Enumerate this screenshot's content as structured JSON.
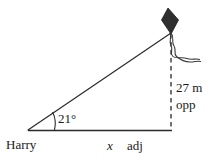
{
  "figure": {
    "type": "right-triangle-trigonometry-diagram",
    "labels": {
      "angle": "21°",
      "height_value": "27 m",
      "height_side_name": "opp",
      "person": "Harry",
      "base_variable": "x",
      "base_side_name": "adj"
    },
    "icons": {
      "kite": "kite-icon",
      "kite_tail": "kite-tail-icon"
    },
    "colors": {
      "line": "#2b2b2b",
      "kite_fill": "#2f2f2f",
      "background": "#ffffff",
      "text": "#1a1a1a"
    },
    "geometry": {
      "vertex_person": [
        28,
        130
      ],
      "vertex_base_right": [
        172,
        130
      ],
      "vertex_kite": [
        171,
        33
      ],
      "angle_arc_radius": 26,
      "opposite_side_style": "dashed",
      "adjacent_side_style": "solid",
      "hypotenuse_style": "solid"
    }
  }
}
